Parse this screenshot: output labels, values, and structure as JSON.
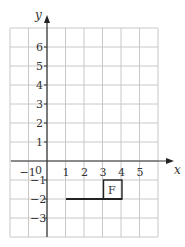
{
  "diagram": {
    "type": "coordinate-grid",
    "axes": {
      "x_label": "x",
      "y_label": "y"
    },
    "x_ticks": [
      "−1",
      "0",
      "1",
      "2",
      "3",
      "4",
      "5"
    ],
    "y_ticks": [
      "6",
      "5",
      "4",
      "3",
      "2",
      "1",
      "−1",
      "−2",
      "−3"
    ],
    "grid": {
      "x_min": -2,
      "x_max": 6,
      "y_min": -4,
      "y_max": 7
    },
    "shape_label": "F",
    "shape": {
      "square": {
        "x1": 3,
        "y1": -2,
        "x2": 4,
        "y2": -1
      },
      "segment": {
        "from": [
          1,
          -2
        ],
        "to": [
          4,
          -2
        ]
      }
    },
    "colors": {
      "grid": "#c8c8c8",
      "axis": "#333333",
      "shape": "#222222"
    }
  }
}
